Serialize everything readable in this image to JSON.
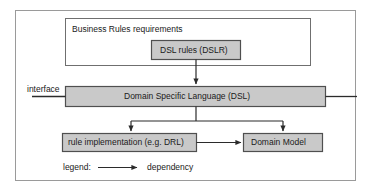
{
  "diagram": {
    "colors": {
      "frame_border": "#9a9a9a",
      "container_border": "#6f6f6f",
      "box_fill": "#c9c9c9",
      "box_border": "#5a5a5a",
      "line": "#3a3a3a",
      "text": "#1a1a1a",
      "background": "#ffffff"
    },
    "containers": [
      {
        "id": "business-rules-requirements",
        "label": "Business Rules requirements"
      }
    ],
    "nodes": [
      {
        "id": "dsl-rules",
        "label": "DSL rules (DSLR)"
      },
      {
        "id": "domain-specific-language",
        "label": "Domain Specific Language (DSL)"
      },
      {
        "id": "rule-implementation",
        "label": "rule implementation (e.g. DRL)"
      },
      {
        "id": "domain-model",
        "label": "Domain Model"
      }
    ],
    "annotations": [
      {
        "id": "interface",
        "label": "interface"
      }
    ],
    "legend": {
      "title": "legend:",
      "entries": [
        {
          "id": "dependency",
          "label": "dependency",
          "symbol": "arrow"
        }
      ]
    },
    "edges": [
      {
        "from": "dsl-rules",
        "to": "domain-specific-language",
        "type": "dependency"
      },
      {
        "from": "domain-specific-language",
        "to": "rule-implementation",
        "type": "dependency"
      },
      {
        "from": "domain-specific-language",
        "to": "domain-model",
        "type": "dependency"
      },
      {
        "from": "rule-implementation",
        "to": "domain-model",
        "type": "dependency"
      }
    ]
  }
}
